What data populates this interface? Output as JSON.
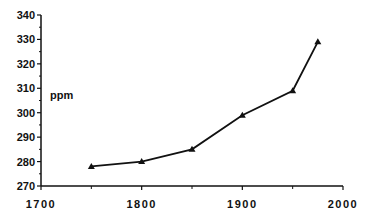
{
  "chart_data": {
    "type": "line",
    "title": "",
    "xlabel": "",
    "ylabel": "ppm",
    "x": [
      1750,
      1800,
      1850,
      1900,
      1950,
      1975
    ],
    "series": [
      {
        "name": "CO2",
        "marker": "triangle",
        "values": [
          278,
          280,
          285,
          299,
          309,
          329
        ]
      }
    ],
    "xlim": [
      1700,
      2000
    ],
    "ylim": [
      270,
      340
    ],
    "x_ticks": [
      1700,
      1800,
      1900,
      2000
    ],
    "x_minor_ticks": [
      1750,
      1850,
      1950
    ],
    "y_ticks": [
      270,
      280,
      290,
      300,
      310,
      320,
      330,
      340
    ],
    "grid": false,
    "legend": null
  },
  "colors": {
    "line": "#111111",
    "axis": "#111111",
    "background": "#ffffff"
  }
}
